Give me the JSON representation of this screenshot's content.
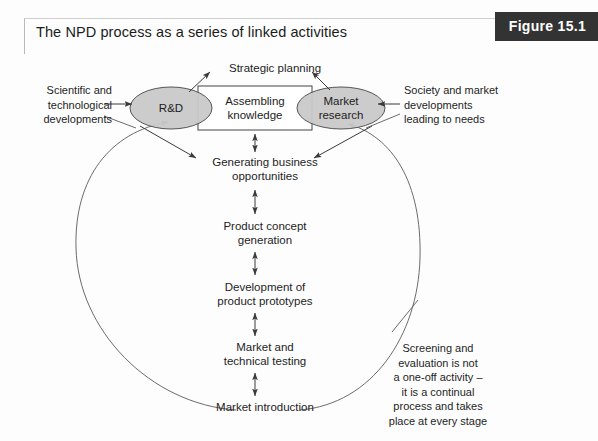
{
  "figure": {
    "title": "The NPD process as a series of linked activities",
    "badge_label": "Figure 15.1"
  },
  "colors": {
    "badge_background": "#333333",
    "badge_text": "#ffffff",
    "ellipse_fill": "#c9c9c9",
    "ellipse_stroke": "#555555",
    "box_fill": "#ffffff",
    "box_stroke": "#444444",
    "arrow_stroke": "#3a3a3a",
    "arc_stroke": "#5a5a5a",
    "page_background": "#fdfdfd",
    "text": "#1d1d1d"
  },
  "diagram": {
    "type": "flow-diagram",
    "ellipses": [
      {
        "id": "rd",
        "label": "R&D"
      },
      {
        "id": "market-research",
        "label": "Market\nresearch"
      }
    ],
    "center_box": {
      "id": "assembling-knowledge",
      "label": "Assembling\nknowledge"
    },
    "process_steps": [
      {
        "id": "strategic-planning",
        "label": "Strategic planning"
      },
      {
        "id": "generating-business-opportunities",
        "label": "Generating business\nopportunities"
      },
      {
        "id": "product-concept-generation",
        "label": "Product concept\ngeneration"
      },
      {
        "id": "development-of-product-prototypes",
        "label": "Development of\nproduct prototypes"
      },
      {
        "id": "market-and-technical-testing",
        "label": "Market and\ntechnical testing"
      },
      {
        "id": "market-introduction",
        "label": "Market introduction"
      }
    ],
    "annotations": [
      {
        "id": "scientific-technological-developments",
        "label": "Scientific and\ntechnological\ndevelopments",
        "position": "left"
      },
      {
        "id": "society-market-developments",
        "label": "Society and market\ndevelopments\nleading to needs",
        "position": "right"
      },
      {
        "id": "screening-and-evaluation",
        "label": "Screening and\nevaluation is not\na one-off activity –\nit is a continual\nprocess and takes\nplace at every stage",
        "position": "bottom-right"
      }
    ],
    "connectors": [
      {
        "from": "rd",
        "to": "strategic-planning",
        "style": "single-arrow"
      },
      {
        "from": "market-research",
        "to": "strategic-planning",
        "style": "single-arrow"
      },
      {
        "from": "assembling-knowledge",
        "to": "generating-business-opportunities",
        "style": "double-arrow"
      },
      {
        "from": "rd",
        "to": "generating-business-opportunities",
        "style": "single-arrow"
      },
      {
        "from": "market-research",
        "to": "generating-business-opportunities",
        "style": "single-arrow"
      },
      {
        "from": "generating-business-opportunities",
        "to": "product-concept-generation",
        "style": "double-arrow"
      },
      {
        "from": "product-concept-generation",
        "to": "development-of-product-prototypes",
        "style": "double-arrow"
      },
      {
        "from": "development-of-product-prototypes",
        "to": "market-and-technical-testing",
        "style": "double-arrow"
      },
      {
        "from": "market-and-technical-testing",
        "to": "market-introduction",
        "style": "double-arrow"
      },
      {
        "from": "scientific-technological-developments",
        "to": "rd",
        "style": "single-arrow"
      },
      {
        "from": "society-market-developments",
        "to": "market-research",
        "style": "single-arrow"
      },
      {
        "from": "market-introduction",
        "to": "rd",
        "style": "feedback-arc"
      },
      {
        "from": "market-introduction",
        "to": "market-research",
        "style": "feedback-arc"
      }
    ]
  }
}
